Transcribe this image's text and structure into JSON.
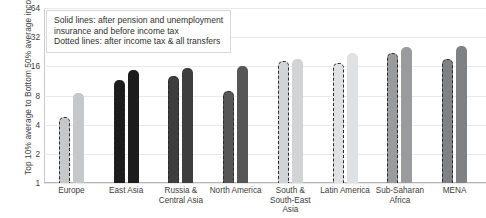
{
  "chart_data": {
    "type": "bar",
    "title": "",
    "xlabel": "",
    "ylabel": "Top 10% average to Bottom 50% average income",
    "yscale": "log2",
    "ylim": [
      1,
      64
    ],
    "yticks": [
      1,
      2,
      4,
      8,
      16,
      32,
      64
    ],
    "ytick_labels": [
      "1",
      "2",
      "4",
      "8",
      "16",
      "32",
      "64"
    ],
    "grid": true,
    "legend_position": "top-left-inside",
    "categories": [
      "Europe",
      "East Asia",
      "Russia & Central Asia",
      "North America",
      "South & South-East Asia",
      "Latin America",
      "Sub-Saharan Africa",
      "MENA"
    ],
    "series": [
      {
        "name": "Dotted lines: after income tax & all transfers",
        "style": "dotted",
        "values": [
          4.8,
          11.5,
          12.8,
          9.0,
          18.0,
          17.5,
          22.0,
          19.0
        ]
      },
      {
        "name": "Solid lines: after pension and unemployment insurance and before income tax",
        "style": "solid",
        "values": [
          8.4,
          14.8,
          15.5,
          16.0,
          19.0,
          22.0,
          25.5,
          26.0
        ]
      }
    ],
    "bar_colors": [
      "#c6c7c8",
      "#1c1c1c",
      "#3e3e3e",
      "#565657",
      "#d2d3d4",
      "#e0e1e2",
      "#9a9b9c",
      "#808182"
    ]
  },
  "legend": {
    "line1": "Solid lines: after pension and unemployment",
    "line2": "insurance and before income tax",
    "line3": "Dotted lines: after income tax & all transfers"
  },
  "axis": {
    "y_title": "Top 10% average to Bottom 50% average income"
  }
}
